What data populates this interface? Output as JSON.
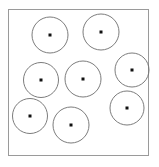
{
  "canvas": {
    "width": 159,
    "height": 167,
    "background_color": "#ffffff"
  },
  "figure": {
    "title": "",
    "caption": ""
  },
  "frame": {
    "name": "bounding-square",
    "x": 8,
    "y": 9,
    "width": 140,
    "height": 146,
    "stroke_color": "#9a9a9a",
    "stroke_width": 1,
    "fill_color": "#ffffff"
  },
  "style": {
    "circle_stroke_color": "#6d6d6d",
    "circle_stroke_width": 0.9,
    "circle_fill": "none",
    "dot_color": "#111111",
    "dot_size": 3
  },
  "chart_data": {
    "type": "scatter",
    "title": "",
    "xlabel": "",
    "ylabel": "",
    "xlim": [
      8,
      148
    ],
    "ylim": [
      9,
      155
    ],
    "grid": false,
    "legend": null,
    "count": 8,
    "units": "pixels",
    "columns": [
      "id",
      "label",
      "cx",
      "cy",
      "r"
    ],
    "circles": [
      {
        "id": 1,
        "label": "top-left",
        "cx": 50,
        "cy": 35,
        "r": 18
      },
      {
        "id": 2,
        "label": "top-right",
        "cx": 101,
        "cy": 32,
        "r": 18
      },
      {
        "id": 3,
        "label": "middle-left",
        "cx": 41,
        "cy": 80,
        "r": 17.5
      },
      {
        "id": 4,
        "label": "middle-center",
        "cx": 83,
        "cy": 79,
        "r": 18
      },
      {
        "id": 5,
        "label": "middle-right",
        "cx": 132,
        "cy": 70,
        "r": 17
      },
      {
        "id": 6,
        "label": "bottom-left",
        "cx": 30,
        "cy": 116,
        "r": 17.5
      },
      {
        "id": 7,
        "label": "bottom-center",
        "cx": 71,
        "cy": 125,
        "r": 18
      },
      {
        "id": 8,
        "label": "bottom-right",
        "cx": 127,
        "cy": 108,
        "r": 17
      }
    ]
  }
}
